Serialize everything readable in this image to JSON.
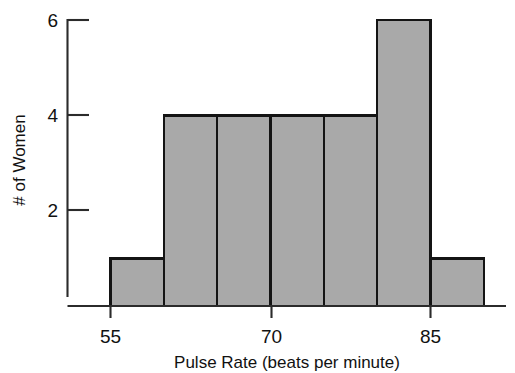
{
  "chart_data": {
    "type": "bar",
    "title": "",
    "subtitle": "",
    "xlabel": "Pulse Rate (beats per minute)",
    "ylabel": "# of Women",
    "categories": [
      "55-60",
      "60-65",
      "65-70",
      "70-75",
      "75-80",
      "80-85",
      "85-90"
    ],
    "bin_edges": [
      55,
      60,
      65,
      70,
      75,
      80,
      85,
      90
    ],
    "values": [
      1,
      4,
      4,
      4,
      4,
      6,
      1
    ],
    "x": [
      57.5,
      62.5,
      67.5,
      72.5,
      77.5,
      82.5,
      87.5
    ],
    "xlim": [
      55,
      90
    ],
    "ylim": [
      0,
      6
    ],
    "xticks": [
      55,
      70,
      85
    ],
    "xtick_labels": [
      "55",
      "70",
      "85"
    ],
    "yticks": [
      2,
      4,
      6
    ],
    "ytick_labels": [
      "2",
      "4",
      "6"
    ],
    "grid": false,
    "legend": null,
    "bar_fill_color": "#a9a9a9",
    "bar_edge_color": "#141414",
    "axis_color": "#2b2b2b",
    "background_color": "#ffffff",
    "annotations": []
  },
  "axes": {
    "y_tick_labels": [
      {
        "text": "6",
        "value": 6
      },
      {
        "text": "4",
        "value": 4
      },
      {
        "text": "2",
        "value": 2
      }
    ],
    "x_tick_labels": [
      {
        "text": "55",
        "value": 55
      },
      {
        "text": "70",
        "value": 70
      },
      {
        "text": "85",
        "value": 85
      }
    ],
    "y_axis_title": "# of Women",
    "x_axis_title": "Pulse Rate (beats per minute)"
  },
  "bars": [
    {
      "label": "55-60",
      "value": 1
    },
    {
      "label": "60-65",
      "value": 4
    },
    {
      "label": "65-70",
      "value": 4
    },
    {
      "label": "70-75",
      "value": 4
    },
    {
      "label": "75-80",
      "value": 4
    },
    {
      "label": "80-85",
      "value": 6
    },
    {
      "label": "85-90",
      "value": 1
    }
  ]
}
